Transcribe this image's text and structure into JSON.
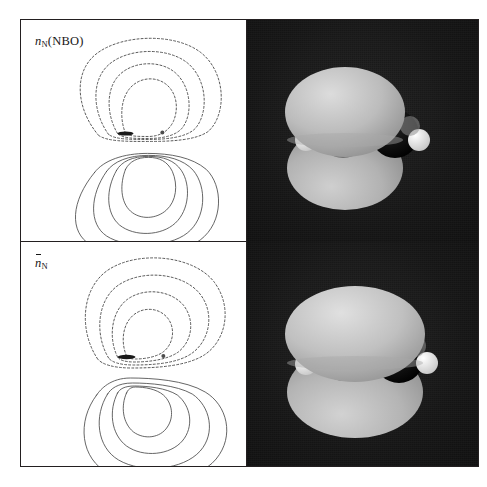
{
  "figure": {
    "kind": "molecular-orbital-figure",
    "background_color": "#ffffff",
    "frame_color": "#231f20",
    "render_background_color": "#141414"
  },
  "rows": [
    {
      "id": "row-nbo",
      "label": {
        "text": "n_N(NBO)",
        "symbol": "n",
        "subscript": "N",
        "suffix": "(NBO)",
        "has_overbar": false
      },
      "contour": {
        "positive_contour_count": 4,
        "negative_contour_count": 4,
        "positive_line_style": "solid",
        "negative_line_style": "dashed",
        "shape": "symmetric two-lobed p-type lone pair centred on nitrogen",
        "nuclei": [
          {
            "name": "N",
            "cx": 125,
            "cy": 133,
            "r": 2.3,
            "style": "major"
          },
          {
            "name": "N-second",
            "cx": 162,
            "cy": 132,
            "r": 1.9,
            "style": "minor"
          }
        ]
      },
      "render": {
        "orbital_lobes": 2,
        "lobe_orientation": "above-and-below molecular plane",
        "lobe_color": "#b9b9b9",
        "molecule": "HN=NH",
        "atoms": [
          {
            "element": "H",
            "color": "#f2f2f2"
          },
          {
            "element": "N",
            "color": "#8c8c8c"
          },
          {
            "element": "N",
            "color": "#0d0d0d"
          },
          {
            "element": "H",
            "color": "#f2f2f2"
          }
        ]
      }
    },
    {
      "id": "row-nbar",
      "label": {
        "text": "n̄_N",
        "symbol": "n",
        "subscript": "N",
        "suffix": "",
        "has_overbar": true
      },
      "contour": {
        "positive_contour_count": 4,
        "negative_contour_count": 4,
        "positive_line_style": "solid",
        "negative_line_style": "dashed",
        "shape": "delocalised asymmetric two-lobed lone pair extended toward the second nitrogen",
        "nuclei": [
          {
            "name": "N",
            "cx": 125,
            "cy": 354,
            "r": 2.3,
            "style": "major"
          },
          {
            "name": "N-second",
            "cx": 162,
            "cy": 353,
            "r": 1.9,
            "style": "minor"
          }
        ]
      },
      "render": {
        "orbital_lobes": 2,
        "lobe_orientation": "above-and-below molecular plane, larger and more diffuse",
        "lobe_color": "#bdbdbd",
        "molecule": "HN=NH",
        "atoms": [
          {
            "element": "H",
            "color": "#f2f2f2"
          },
          {
            "element": "N",
            "color": "#8c8c8c"
          },
          {
            "element": "N",
            "color": "#0d0d0d"
          },
          {
            "element": "H",
            "color": "#f2f2f2"
          }
        ]
      }
    }
  ]
}
